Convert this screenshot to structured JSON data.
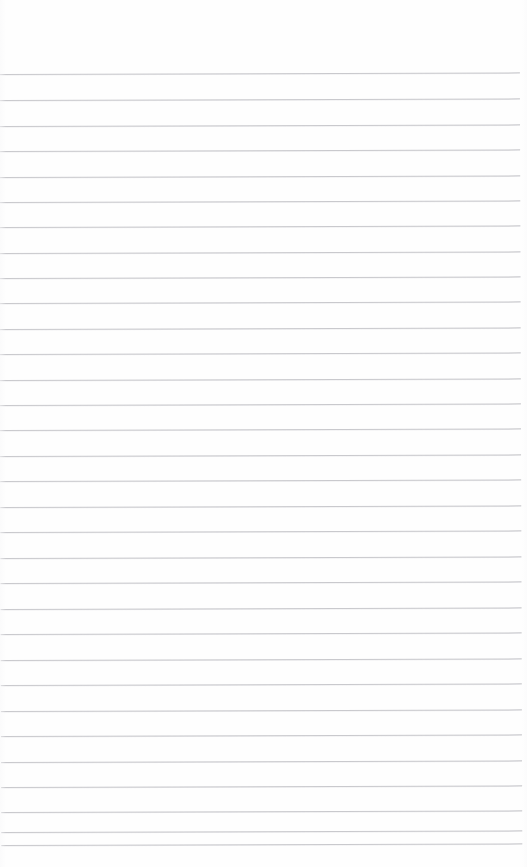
{
  "document": {
    "type": "ruled-paper",
    "title": "Blank ruled notebook page",
    "page_width": 527,
    "page_height": 867,
    "background_color": "#ffffff",
    "paper_color": "#fefefe",
    "has_text_content": false,
    "has_header": false,
    "has_margin_rule": false,
    "visible_text": ""
  },
  "ruling": {
    "line_color": "#c9c9cd",
    "line_thickness_px": 1,
    "line_count": 32,
    "line_spacing_px": 25.5,
    "first_line_y": 74,
    "last_line_y": 845,
    "line_start_x": 0,
    "line_end_x": 521,
    "top_margin_px": 74,
    "bottom_margin_px": 22,
    "right_margin_px": 6,
    "skew_degrees": -0.18,
    "line_y_positions": [
      74,
      100,
      126,
      151,
      177,
      202,
      227,
      253,
      278,
      303,
      329,
      354,
      380,
      405,
      430,
      456,
      481,
      507,
      532,
      558,
      583,
      609,
      634,
      660,
      685,
      711,
      736,
      762,
      787,
      812,
      832,
      845
    ]
  }
}
